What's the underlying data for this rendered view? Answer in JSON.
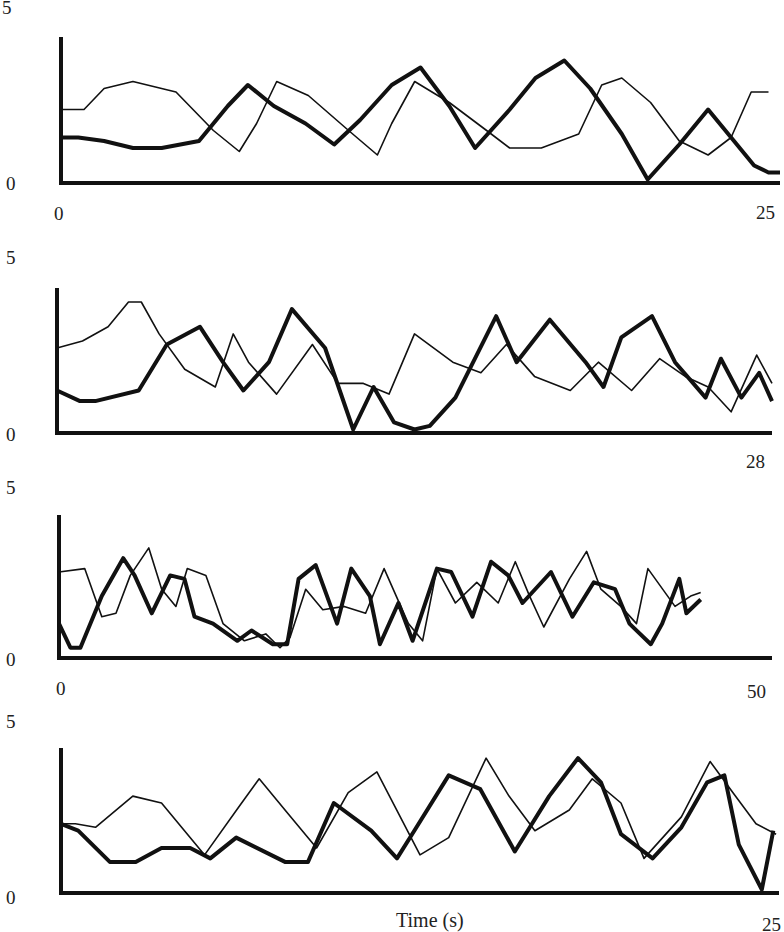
{
  "chart_data": [
    {
      "type": "line",
      "panel": 1,
      "xlim": [
        0,
        25
      ],
      "ylim": [
        0,
        5
      ],
      "ytick_labels": [
        "5",
        "0"
      ],
      "xtick_labels": [
        "0",
        "25"
      ],
      "series": [
        {
          "name": "thick",
          "style": "bold",
          "x": [
            0,
            0.6,
            1.5,
            2.5,
            3.5,
            4.8,
            5.8,
            6.5,
            7.4,
            8.5,
            9.5,
            10.4,
            11.5,
            12.5,
            13.5,
            14.4,
            15.6,
            16.5,
            17.5,
            18.4,
            19.5,
            20.4,
            21.5,
            22.5,
            23.4,
            24.1,
            24.6,
            25
          ],
          "y": [
            1.3,
            1.3,
            1.2,
            1.0,
            1.0,
            1.2,
            2.2,
            2.8,
            2.2,
            1.7,
            1.1,
            1.8,
            2.8,
            3.3,
            2.2,
            1.0,
            2.1,
            3.0,
            3.5,
            2.7,
            1.4,
            0.1,
            1.1,
            2.1,
            1.2,
            0.5,
            0.3,
            0.3
          ]
        },
        {
          "name": "thin",
          "style": "regular",
          "x": [
            0,
            0.8,
            1.5,
            2.5,
            4.0,
            5.3,
            6.2,
            6.8,
            7.5,
            8.6,
            10.0,
            11.0,
            11.5,
            12.3,
            13.5,
            14.8,
            15.6,
            16.7,
            18.0,
            18.8,
            19.5,
            20.5,
            21.5,
            22.5,
            23.3,
            24.0,
            24.6
          ],
          "y": [
            2.1,
            2.1,
            2.7,
            2.9,
            2.6,
            1.5,
            0.9,
            1.7,
            2.9,
            2.5,
            1.5,
            0.8,
            1.7,
            2.9,
            2.3,
            1.5,
            1.0,
            1.0,
            1.4,
            2.8,
            3.0,
            2.3,
            1.2,
            0.8,
            1.3,
            2.6,
            2.6
          ]
        }
      ]
    },
    {
      "type": "line",
      "panel": 2,
      "xlim": [
        0,
        28
      ],
      "ylim": [
        0,
        5
      ],
      "ytick_labels": [
        "5",
        "0"
      ],
      "xtick_labels": [
        "28"
      ],
      "series": [
        {
          "name": "thick",
          "style": "bold",
          "x": [
            0,
            0.9,
            1.5,
            3.2,
            4.3,
            5.6,
            6.5,
            7.3,
            8.3,
            9.2,
            10.5,
            11.6,
            12.4,
            13.2,
            14.0,
            14.6,
            15.6,
            17.2,
            18.0,
            19.3,
            20.7,
            21.4,
            22.1,
            23.3,
            24.2,
            25.4,
            26.0,
            26.8,
            27.5,
            28
          ],
          "y": [
            1.2,
            0.9,
            0.9,
            1.2,
            2.5,
            3.0,
            2.0,
            1.2,
            2.0,
            3.5,
            2.4,
            0.1,
            1.3,
            0.3,
            0.1,
            0.2,
            1.0,
            3.3,
            2.0,
            3.2,
            2.0,
            1.3,
            2.7,
            3.3,
            2.0,
            1.0,
            2.1,
            1.0,
            1.7,
            0.9
          ]
        },
        {
          "name": "thin",
          "style": "regular",
          "x": [
            0,
            1.0,
            2.0,
            2.8,
            3.3,
            4.0,
            5.0,
            6.2,
            6.9,
            7.5,
            8.6,
            10.0,
            11.0,
            12.0,
            13.0,
            14.0,
            15.5,
            16.6,
            17.6,
            18.7,
            20.1,
            21.2,
            22.5,
            23.6,
            24.6,
            25.5,
            26.4,
            27.4,
            28
          ],
          "y": [
            2.4,
            2.6,
            3.0,
            3.7,
            3.7,
            2.8,
            1.8,
            1.3,
            2.8,
            2.0,
            1.1,
            2.5,
            1.4,
            1.4,
            1.1,
            2.8,
            2.0,
            1.7,
            2.5,
            1.6,
            1.2,
            2.0,
            1.2,
            2.1,
            1.6,
            1.3,
            0.6,
            2.2,
            1.4
          ]
        }
      ]
    },
    {
      "type": "line",
      "panel": 3,
      "xlim": [
        0,
        50
      ],
      "ylim": [
        0,
        5
      ],
      "ytick_labels": [
        "5",
        "0"
      ],
      "xtick_labels": [
        "0",
        "50"
      ],
      "series": [
        {
          "name": "thick",
          "style": "bold",
          "x": [
            0,
            0.8,
            1.5,
            3.0,
            4.5,
            5.3,
            6.5,
            7.8,
            8.8,
            9.5,
            10.8,
            12.5,
            13.5,
            15.0,
            16.0,
            16.8,
            18.0,
            19.5,
            20.5,
            21.8,
            22.5,
            23.8,
            24.8,
            26.5,
            27.5,
            29.0,
            30.3,
            31.5,
            32.5,
            34.5,
            36.0,
            37.5,
            39.0,
            40.0,
            41.5,
            42.3,
            43.5,
            44.0,
            45.0
          ],
          "y": [
            1.0,
            0.3,
            0.3,
            1.8,
            2.9,
            2.4,
            1.3,
            2.4,
            2.3,
            1.2,
            1.0,
            0.5,
            0.8,
            0.4,
            0.4,
            2.3,
            2.7,
            1.0,
            2.6,
            1.8,
            0.4,
            1.6,
            0.5,
            2.6,
            2.5,
            1.2,
            2.8,
            2.4,
            1.6,
            2.5,
            1.2,
            2.2,
            2.0,
            1.0,
            0.4,
            1.0,
            2.3,
            1.3,
            1.7
          ]
        },
        {
          "name": "thin",
          "style": "regular",
          "x": [
            0,
            1.8,
            3.0,
            4.0,
            5.0,
            6.3,
            7.2,
            8.2,
            9.0,
            10.3,
            11.5,
            13.0,
            14.5,
            15.5,
            16.2,
            17.3,
            18.5,
            20.0,
            21.5,
            22.8,
            24.5,
            25.5,
            26.5,
            27.8,
            29.3,
            30.8,
            32.0,
            33.0,
            34.0,
            35.8,
            37.0,
            38.0,
            39.4,
            40.5,
            41.3,
            43.2,
            44.3,
            45.0
          ],
          "y": [
            2.5,
            2.6,
            1.2,
            1.3,
            2.4,
            3.2,
            2.0,
            1.5,
            2.6,
            2.4,
            1.0,
            0.5,
            0.7,
            0.3,
            0.6,
            2.0,
            1.4,
            1.5,
            1.3,
            2.6,
            1.0,
            0.5,
            2.6,
            1.6,
            2.2,
            1.6,
            2.8,
            1.8,
            0.9,
            2.3,
            3.1,
            2.0,
            1.5,
            1.0,
            2.6,
            1.5,
            1.8,
            1.9
          ]
        }
      ]
    },
    {
      "type": "line",
      "panel": 4,
      "xlim": [
        0,
        25
      ],
      "ylim": [
        0,
        5
      ],
      "ytick_labels": [
        "5",
        "0"
      ],
      "xtick_labels": [
        "25"
      ],
      "xlabel": "Time (s)",
      "series": [
        {
          "name": "thick",
          "style": "bold",
          "x": [
            0,
            0.6,
            1.7,
            2.6,
            3.5,
            4.5,
            5.2,
            6.1,
            7.8,
            8.6,
            9.5,
            10.8,
            11.7,
            12.3,
            13.5,
            14.6,
            15.8,
            17.0,
            18.0,
            18.8,
            19.5,
            20.6,
            21.6,
            22.5,
            23.1,
            23.6,
            24.4,
            24.8
          ],
          "y": [
            2.0,
            1.8,
            0.9,
            0.9,
            1.3,
            1.3,
            1.0,
            1.6,
            0.9,
            0.9,
            2.6,
            1.8,
            1.0,
            1.8,
            3.4,
            3.0,
            1.2,
            2.8,
            3.9,
            3.2,
            1.7,
            1.0,
            1.9,
            3.2,
            3.4,
            1.4,
            0.1,
            1.8
          ]
        },
        {
          "name": "thin",
          "style": "regular",
          "x": [
            0,
            0.5,
            1.2,
            2.5,
            3.5,
            5.0,
            6.2,
            6.9,
            7.9,
            8.9,
            10.0,
            11.0,
            12.5,
            13.5,
            14.8,
            15.6,
            16.5,
            17.7,
            18.5,
            19.5,
            20.3,
            21.6,
            22.6,
            23.4,
            24.2,
            24.9
          ],
          "y": [
            2.0,
            2.0,
            1.9,
            2.8,
            2.6,
            1.1,
            2.5,
            3.3,
            2.3,
            1.3,
            2.9,
            3.5,
            1.1,
            1.6,
            3.9,
            2.8,
            1.8,
            2.4,
            3.3,
            2.6,
            1.0,
            2.2,
            3.8,
            2.9,
            2.0,
            1.7
          ]
        }
      ]
    }
  ],
  "panels": [
    {
      "ytop_label": "5",
      "ybottom_label": "0",
      "xleft_label": "0",
      "xright_label": "25"
    },
    {
      "ytop_label": "5",
      "ybottom_label": "0",
      "xleft_label": "",
      "xright_label": "28"
    },
    {
      "ytop_label": "5",
      "ybottom_label": "0",
      "xleft_label": "0",
      "xright_label": "50"
    },
    {
      "ytop_label": "5",
      "ybottom_label": "0",
      "xleft_label": "",
      "xright_label": "25"
    }
  ],
  "xlabel": "Time (s)"
}
